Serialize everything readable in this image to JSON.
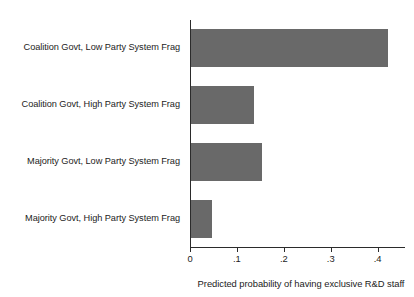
{
  "chart_data": {
    "type": "bar",
    "orientation": "horizontal",
    "title": "",
    "xlabel": "Predicted probability of having exclusive R&D staff",
    "ylabel": "",
    "categories": [
      "Coalition Govt, Low Party System Frag",
      "Coalition Govt, High Party System Frag",
      "Majority Govt, Low Party System Frag",
      "Majority Govt, High Party System Frag"
    ],
    "values": [
      0.42,
      0.135,
      0.152,
      0.044
    ],
    "xlim": [
      0,
      0.452
    ],
    "xticks": [
      0,
      0.1,
      0.2,
      0.3,
      0.4
    ],
    "xticklabels": [
      "0",
      ".1",
      ".2",
      ".3",
      ".4"
    ],
    "grid": false,
    "legend": null,
    "bar_color": "#696969",
    "axis_color": "#2b2b2b"
  }
}
